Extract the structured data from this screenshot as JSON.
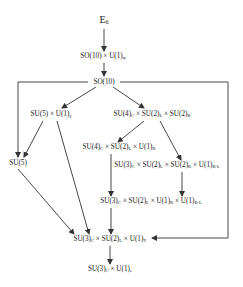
{
  "diagram": {
    "type": "symmetry-breaking-chain",
    "nodes": [
      {
        "id": "e6",
        "base": "E",
        "sub": "6",
        "x": 104,
        "y": 21
      },
      {
        "id": "so10u1",
        "label": "SO(10) × U(1)",
        "sub": "ψ",
        "x": 103,
        "y": 57
      },
      {
        "id": "so10",
        "label": "SO(10)",
        "x": 104,
        "y": 82
      },
      {
        "id": "su5u1",
        "label": "SU(5) × U(1)",
        "sub": "χ",
        "x": 51,
        "y": 115
      },
      {
        "id": "su4su2su2",
        "parts": [
          [
            "SU(4)",
            "C"
          ],
          [
            " × SU(2)",
            "L"
          ],
          [
            " × SU(2)",
            "R"
          ]
        ],
        "x": 152,
        "y": 115
      },
      {
        "id": "su4su2u1",
        "parts": [
          [
            "SU(4)",
            "C"
          ],
          [
            " × SU(2)",
            "L"
          ],
          [
            " × U(1)",
            "R"
          ]
        ],
        "x": 119,
        "y": 148
      },
      {
        "id": "su3su2su2u1",
        "parts": [
          [
            "SU(3)",
            "C"
          ],
          [
            " × SU(2)",
            "L"
          ],
          [
            " × SU(2)",
            "R"
          ],
          [
            " × U(1)",
            "B-L"
          ]
        ],
        "x": 165,
        "y": 166
      },
      {
        "id": "su5",
        "label": "SU(5)",
        "x": 18,
        "y": 163
      },
      {
        "id": "su3su2u1u1",
        "parts": [
          [
            "SU(3)",
            "C"
          ],
          [
            " × SU(2)",
            "L"
          ],
          [
            " × U(1)",
            "R"
          ],
          [
            " × U(1)",
            "B-L"
          ]
        ],
        "x": 151,
        "y": 202
      },
      {
        "id": "sm",
        "parts": [
          [
            "SU(3)",
            "C"
          ],
          [
            " × SU(2)",
            "L"
          ],
          [
            " × U(1)",
            "Y"
          ]
        ],
        "x": 110,
        "y": 240
      },
      {
        "id": "su3u1em",
        "parts": [
          [
            "SU(3)",
            "C"
          ],
          [
            " × U(1)",
            "e"
          ]
        ],
        "x": 110,
        "y": 270
      }
    ],
    "edges": [
      {
        "from": "e6",
        "to": "so10u1"
      },
      {
        "from": "so10u1",
        "to": "so10"
      },
      {
        "from": "so10",
        "to": "su5u1"
      },
      {
        "from": "so10",
        "to": "su4su2su2"
      },
      {
        "from": "so10",
        "to": "su5",
        "route": "left-bracket"
      },
      {
        "from": "so10",
        "to": "sm",
        "route": "right-bracket"
      },
      {
        "from": "su5u1",
        "to": "su5"
      },
      {
        "from": "su5u1",
        "to": "sm"
      },
      {
        "from": "su4su2su2",
        "to": "su4su2u1"
      },
      {
        "from": "su4su2su2",
        "to": "su3su2su2u1"
      },
      {
        "from": "su4su2u1",
        "to": "su3su2u1u1"
      },
      {
        "from": "su3su2su2u1",
        "to": "su3su2u1u1"
      },
      {
        "from": "su5",
        "to": "sm"
      },
      {
        "from": "su3su2u1u1",
        "to": "sm"
      },
      {
        "from": "sm",
        "to": "su3u1em"
      }
    ],
    "colors": {
      "line": "#333333",
      "text": "#222222",
      "background": "#ffffff"
    }
  },
  "labels": {
    "e6": "E",
    "e6_sub": "6",
    "so10u1": "SO(10) × U(1)",
    "so10u1_sub": "ψ",
    "so10": "SO(10)",
    "su5u1": "SU(5) × U(1)",
    "su5u1_sub": "χ",
    "su5": "SU(5)",
    "su4su2su2_a": "SU(4)",
    "su4su2su2_a_sub": "C",
    "su4su2su2_b": " × SU(2)",
    "su4su2su2_b_sub": "L",
    "su4su2su2_c": " × SU(2)",
    "su4su2su2_c_sub": "R",
    "su4su2u1_a": "SU(4)",
    "su4su2u1_a_sub": "C",
    "su4su2u1_b": " × SU(2)",
    "su4su2u1_b_sub": "L",
    "su4su2u1_c": " × U(1)",
    "su4su2u1_c_sub": "R",
    "lr_a": "SU(3)",
    "lr_a_sub": "C",
    "lr_b": " × SU(2)",
    "lr_b_sub": "L",
    "lr_c": " × SU(2)",
    "lr_c_sub": "R",
    "lr_d": " × U(1)",
    "lr_d_sub": "B-L",
    "u1u1_a": "SU(3)",
    "u1u1_a_sub": "C",
    "u1u1_b": " × SU(2)",
    "u1u1_b_sub": "L",
    "u1u1_c": " × U(1)",
    "u1u1_c_sub": "R",
    "u1u1_d": " × U(1)",
    "u1u1_d_sub": "B-L",
    "sm_a": "SU(3)",
    "sm_a_sub": "C",
    "sm_b": " × SU(2)",
    "sm_b_sub": "L",
    "sm_c": " × U(1)",
    "sm_c_sub": "Y",
    "em_a": "SU(3)",
    "em_a_sub": "C",
    "em_b": " × U(1)",
    "em_b_sub": "e"
  }
}
